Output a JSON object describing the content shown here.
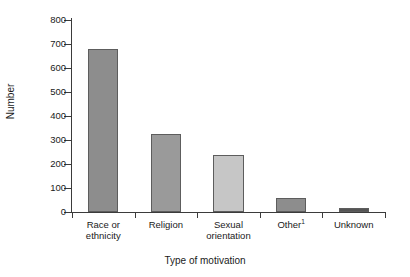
{
  "chart_data": {
    "type": "bar",
    "title": "",
    "xlabel": "Type of motivation",
    "ylabel": "Number",
    "categories": [
      "Race or ethnicity",
      "Religion",
      "Sexual orientation",
      "Other¹",
      "Unknown"
    ],
    "category_lines": [
      [
        "Race or",
        "ethnicity"
      ],
      [
        "Religion"
      ],
      [
        "Sexual",
        "orientation"
      ],
      [
        "Other¹"
      ],
      [
        "Unknown"
      ]
    ],
    "values": [
      680,
      325,
      238,
      58,
      17
    ],
    "bar_colors": [
      "#8d8d8d",
      "#9a9a9a",
      "#c6c6c6",
      "#8d8d8d",
      "#555555"
    ],
    "ylim": [
      0,
      800
    ],
    "yticks": [
      0,
      100,
      200,
      300,
      400,
      500,
      600,
      700,
      800
    ],
    "ytick_labels": [
      "0",
      "100",
      "200",
      "300",
      "400",
      "500",
      "600",
      "700",
      "800"
    ],
    "grid": false,
    "legend": "none",
    "axis_color": "#3b3b3b",
    "background": "#ffffff"
  }
}
